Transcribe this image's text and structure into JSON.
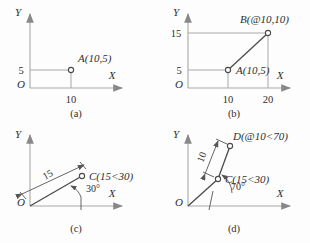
{
  "figure": {
    "background_color": "#fdfdfd",
    "axis_color": "#a8a8a8",
    "object_line_color": "#4a4a4a",
    "text_color": "#2e2e2e"
  },
  "panels": [
    {
      "id": "a",
      "caption": "(a)",
      "axis_x_label": "X",
      "axis_y_label": "Y",
      "origin_label": "O",
      "y_ticks": [
        "5"
      ],
      "x_ticks": [
        "10"
      ],
      "points": [
        {
          "name": "A",
          "label": "A(10,5)",
          "coord_x": 10,
          "coord_y": 5,
          "notation": "absolute-cartesian"
        }
      ]
    },
    {
      "id": "b",
      "caption": "(b)",
      "axis_x_label": "X",
      "axis_y_label": "Y",
      "origin_label": "O",
      "y_ticks": [
        "15",
        "5"
      ],
      "x_ticks": [
        "10",
        "20"
      ],
      "points": [
        {
          "name": "A",
          "label": "A(10,5)",
          "coord_x": 10,
          "coord_y": 5,
          "notation": "absolute-cartesian"
        },
        {
          "name": "B",
          "label": "B(@10,10)",
          "coord_x": 20,
          "coord_y": 15,
          "notation": "relative-cartesian"
        }
      ]
    },
    {
      "id": "c",
      "caption": "(c)",
      "axis_x_label": "X",
      "axis_y_label": "Y",
      "origin_label": "O",
      "dimension_label": "15",
      "angle_label": "30°",
      "points": [
        {
          "name": "C",
          "label": "C(15<30)",
          "radius": 15,
          "angle": 30,
          "notation": "absolute-polar"
        }
      ]
    },
    {
      "id": "d",
      "caption": "(d)",
      "axis_x_label": "X",
      "axis_y_label": "Y",
      "origin_label": "O",
      "dimension_label": "10",
      "angle_label": "70°",
      "points": [
        {
          "name": "C",
          "label": "C(15<30)",
          "radius": 15,
          "angle": 30,
          "notation": "absolute-polar"
        },
        {
          "name": "D",
          "label": "D(@10<70)",
          "radius": 10,
          "angle": 70,
          "notation": "relative-polar"
        }
      ]
    }
  ]
}
